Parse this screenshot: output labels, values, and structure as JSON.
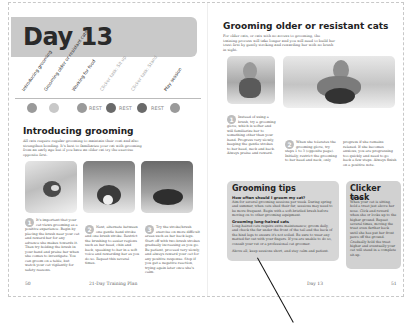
{
  "left_page": {
    "banner": {
      "title": "Day 13"
    },
    "timeline": {
      "labels": [
        "Introducing grooming",
        "Grooming older or resistant cats",
        "Working for food",
        "Clicker task: Sit up",
        "Clicker task: Stand",
        "Play session"
      ],
      "rest_labels": [
        "REST",
        "REST",
        "REST"
      ]
    },
    "section": {
      "heading": "Introducing grooming",
      "intro": "All cats require regular grooming to maintain their coat and also strengthen bonding. It's best to familiarize your cat with grooming from an early age but if you have an older cat try the exercise opposite first."
    },
    "steps": [
      {
        "num": "1",
        "text": "It's important that your cat views grooming as a positive experience. Begin by placing the brush near your cat and reward her for any advance she makes towards it. Then try holding the brush in your hand and praise her when she comes to investigate. You can groom on a table, but watch your cat vigilantly for safety reasons."
      },
      {
        "num": "2",
        "text": "Next, alternate between one gentle hand stroke and one brush stroke. Restrict the brushing to easier regions such as her head, chin and back, speaking to her in a soft voice and rewarding her as you do so. Repeat this several times."
      },
      {
        "num": "3",
        "text": "Try the stroke/brush exercise on more difficult areas such as her back legs. Start off with two brush strokes gradually increasing as you go. Be patient, proceed very slowly, and always reward your cat for any positive response. Stop if you get a negative reaction, trying again later once she's calm."
      }
    ],
    "footer": {
      "page_number": "50",
      "book_title": "21-Day Training Plan"
    }
  },
  "right_page": {
    "section": {
      "heading": "Grooming older or resistant cats",
      "intro": "For older cats, or cats with no access to grooming, the training process will take longer and you will need to build her trust first by gently stroking and rewarding her with no brush in sight."
    },
    "steps": [
      {
        "num": "1",
        "text": "Instead of using a brush, try a grooming glove, which is softer and will familiarize her to something other than your hand. Progress very slowly, keeping the gentle strokes to her head, neck and back. Always praise and reward."
      },
      {
        "num": "2",
        "text": "When she tolerates the grooming glove, try steps 1 to 3 (opposite page). Initially, restrict the grooming to her head and neck, only"
      },
      {
        "num": "",
        "text": "progress if she remains relaxed. If she becomes anxious, you are progressing too quickly and need to go back a few steps. Always finish on a positive note."
      }
    ],
    "tips_box": {
      "title": "Grooming tips",
      "sub1": "How often should I groom my cat?",
      "text1": "Aim for several grooming sessions per week. During spring and summer, when cats shed their fur, sessions may need to be more frequent. Begin with a soft-bristled brush before moving on to other grooming equipment.",
      "sub2": "Grooming long-haired cats",
      "text2": "Long-haired cats require extra maintenance; groom daily, and check the fur under the front of the tail and the back of the hind legs to ensure it's not soiled. Be sure to wear any matted fur out with your fingers. If you are unable to do so, consult your vet or a professional cat groomer.",
      "text3": "Above all, keep sessions short, and stay calm and patient."
    },
    "clicker_box": {
      "title": "Clicker task",
      "sub": "Sit up",
      "text": "When your cat is sitting, hold a treat just above her nose. Click and reward when she or looks up to the higher ground. Repeat several times, moving the treat even further back until she has put her front paws off the ground. Gradually hold the treat higher and eventually your cat will stand in a complete sit-up."
    },
    "footer": {
      "running_head": "Day 13",
      "page_number": "51"
    }
  }
}
